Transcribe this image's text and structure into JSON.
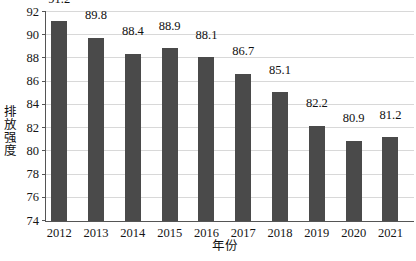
{
  "chart_data": {
    "type": "bar",
    "title": "",
    "xlabel": "年份",
    "ylabel": "排放强度",
    "categories": [
      "2012",
      "2013",
      "2014",
      "2015",
      "2016",
      "2017",
      "2018",
      "2019",
      "2020",
      "2021"
    ],
    "values": [
      91.2,
      89.8,
      88.4,
      88.9,
      88.1,
      86.7,
      85.1,
      82.2,
      80.9,
      81.2
    ],
    "ylim": [
      74,
      92
    ],
    "ytick_labels": [
      "74",
      "76",
      "78",
      "80",
      "82",
      "84",
      "86",
      "88",
      "90",
      "92"
    ],
    "ytick_values": [
      74,
      76,
      78,
      80,
      82,
      84,
      86,
      88,
      90,
      92
    ],
    "grid": true,
    "legend": "none",
    "bar_color": "#4a4a4a",
    "grid_color": "#d8d8d8",
    "axis_color": "#555555",
    "background": "#ffffff",
    "data_labels": [
      "91.2",
      "89.8",
      "88.4",
      "88.9",
      "88.1",
      "86.7",
      "85.1",
      "82.2",
      "80.9",
      "81.2"
    ]
  }
}
